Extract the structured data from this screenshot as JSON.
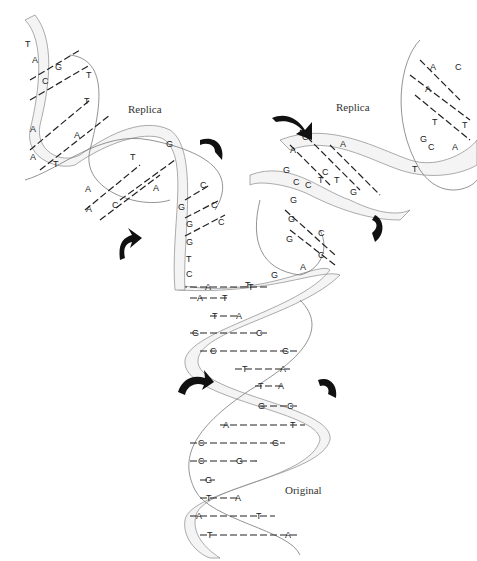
{
  "diagram": {
    "labels": {
      "replica_left": "Replica",
      "replica_right": "Replica",
      "original": "Original"
    },
    "original_pairs": [
      [
        "A",
        "T"
      ],
      [
        "A",
        "T"
      ],
      [
        "T",
        "A"
      ],
      [
        "G",
        "C"
      ],
      [
        "C",
        "G"
      ],
      [
        "T",
        "A"
      ],
      [
        "T",
        "A"
      ],
      [
        "G",
        "C"
      ],
      [
        "A",
        "T"
      ],
      [
        "C",
        "G"
      ],
      [
        "C",
        "G"
      ],
      [
        "G",
        ""
      ],
      [
        "T",
        "A"
      ],
      [
        "A",
        "T"
      ],
      [
        "T",
        "A"
      ]
    ],
    "left_replica_pairs": [
      [
        "T",
        ""
      ],
      [
        "A",
        ""
      ],
      [
        "C",
        "G"
      ],
      [
        "A",
        "T"
      ],
      [
        "A",
        "T"
      ],
      [
        "T",
        "A"
      ],
      [
        "A",
        "T"
      ],
      [
        "A",
        "T"
      ],
      [
        "C",
        "A"
      ],
      [
        "C",
        "G"
      ]
    ],
    "left_fork_unpaired": [
      "G",
      "G",
      "G",
      "T",
      "C"
    ],
    "left_fork_partners": [
      "C",
      "C",
      "C"
    ],
    "right_replica_pairs": [
      [
        "A",
        "C"
      ],
      [
        "A",
        "T"
      ],
      [
        "T",
        "A"
      ],
      [
        "C",
        "A"
      ],
      [
        "A",
        "T"
      ],
      [
        "T",
        "G"
      ],
      [
        "G",
        "C"
      ]
    ],
    "right_fork_pairs": [
      [
        "G",
        "C"
      ],
      [
        "G",
        "C"
      ],
      [
        "A",
        ""
      ],
      [
        "G",
        ""
      ],
      [
        "T",
        ""
      ]
    ],
    "colors": {
      "ink": "#222222",
      "ribbon": "#f4f4f4",
      "arrow": "#111111",
      "background": "#ffffff"
    }
  }
}
